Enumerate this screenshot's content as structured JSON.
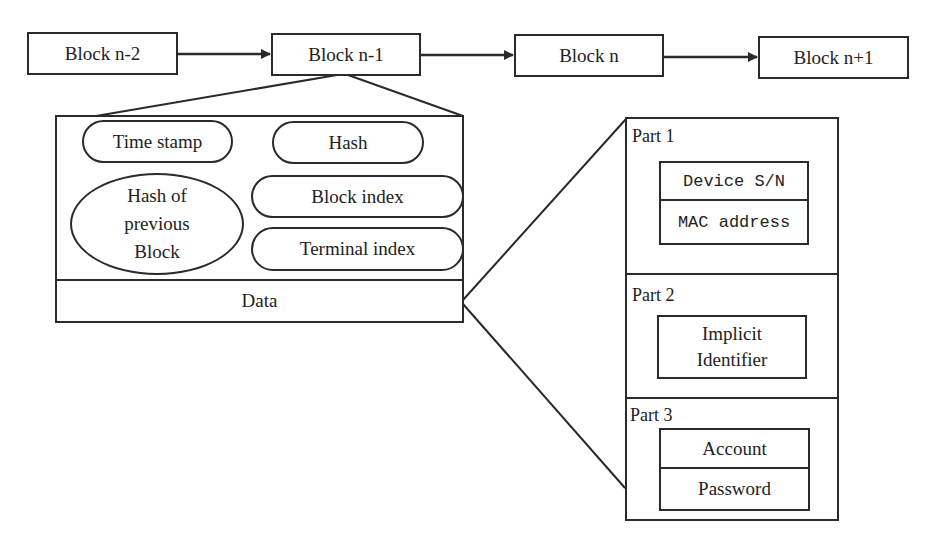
{
  "chain": {
    "blocks": [
      {
        "label": "Block n-2"
      },
      {
        "label": "Block n-1"
      },
      {
        "label": "Block n"
      },
      {
        "label": "Block n+1"
      }
    ]
  },
  "block_detail": {
    "fields": {
      "time_stamp": "Time stamp",
      "hash": "Hash",
      "hash_prev_line1": "Hash of",
      "hash_prev_line2": "previous",
      "hash_prev_line3": "Block",
      "block_index": "Block index",
      "terminal_index": "Terminal index"
    },
    "data_label": "Data"
  },
  "data_detail": {
    "parts": [
      {
        "label": "Part 1",
        "items": [
          "Device S/N",
          "MAC address"
        ]
      },
      {
        "label": "Part 2",
        "items_line1": "Implicit",
        "items_line2": "Identifier"
      },
      {
        "label": "Part 3",
        "items": [
          "Account",
          "Password"
        ]
      }
    ]
  },
  "colors": {
    "stroke": "#2a2a2a",
    "background": "#ffffff"
  }
}
